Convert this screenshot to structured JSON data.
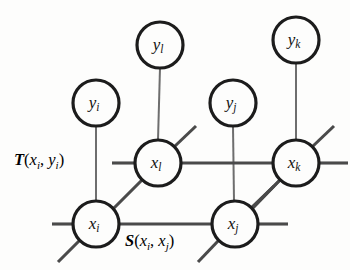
{
  "figure": {
    "background_color": "#fdfdfc",
    "edge_color": "#4a4a4a",
    "node_stroke_color": "#1c1c1c",
    "node_fill_color": "#fdfdfc",
    "label_color": "#101010"
  },
  "nodes": [
    {
      "id": "y_l",
      "base": "y",
      "sub": "l",
      "cx": 160,
      "cy": 45,
      "r": 23
    },
    {
      "id": "y_k",
      "base": "y",
      "sub": "k",
      "cx": 296,
      "cy": 40,
      "r": 23
    },
    {
      "id": "y_i",
      "base": "y",
      "sub": "i",
      "cx": 96,
      "cy": 103,
      "r": 23
    },
    {
      "id": "y_j",
      "base": "y",
      "sub": "j",
      "cx": 233,
      "cy": 103,
      "r": 23
    },
    {
      "id": "x_l",
      "base": "x",
      "sub": "l",
      "cx": 158,
      "cy": 163,
      "r": 23
    },
    {
      "id": "x_k",
      "base": "x",
      "sub": "k",
      "cx": 296,
      "cy": 163,
      "r": 23
    },
    {
      "id": "x_i",
      "base": "x",
      "sub": "i",
      "cx": 96,
      "cy": 224,
      "r": 23
    },
    {
      "id": "x_j",
      "base": "x",
      "sub": "j",
      "cx": 235,
      "cy": 224,
      "r": 23
    }
  ],
  "edges": [
    {
      "id": "edge-yl-xl",
      "from": "y_l",
      "to": "x_l",
      "kind": "thin",
      "x1": 160,
      "y1": 68,
      "x2": 158,
      "y2": 140
    },
    {
      "id": "edge-yk-xk",
      "from": "y_k",
      "to": "x_k",
      "kind": "thin",
      "x1": 296,
      "y1": 63,
      "x2": 296,
      "y2": 140
    },
    {
      "id": "edge-yi-xi",
      "from": "y_i",
      "to": "x_i",
      "kind": "thin",
      "x1": 96,
      "y1": 126,
      "x2": 96,
      "y2": 201
    },
    {
      "id": "edge-yj-xj",
      "from": "y_j",
      "to": "x_j",
      "kind": "thin",
      "x1": 233,
      "y1": 126,
      "x2": 234,
      "y2": 201
    },
    {
      "id": "edge-xl-xk",
      "from": "x_l",
      "to": "x_k",
      "kind": "main",
      "x1": 181,
      "y1": 163,
      "x2": 273,
      "y2": 163
    },
    {
      "id": "edge-xi-xj",
      "from": "x_i",
      "to": "x_j",
      "kind": "main",
      "x1": 119,
      "y1": 224,
      "x2": 212,
      "y2": 224
    },
    {
      "id": "edge-xi-xl",
      "from": "x_i",
      "to": "x_l",
      "kind": "main",
      "x1": 113,
      "y1": 209,
      "x2": 142,
      "y2": 180
    },
    {
      "id": "edge-xj-xk",
      "from": "x_j",
      "to": "x_k",
      "kind": "main",
      "x1": 252,
      "y1": 209,
      "x2": 280,
      "y2": 180
    }
  ],
  "stubs": [
    {
      "id": "stub-xl-left",
      "at": "x_l",
      "kind": "main",
      "x1": 112,
      "y1": 163,
      "x2": 135,
      "y2": 163
    },
    {
      "id": "stub-xl-upright",
      "at": "x_l",
      "kind": "main",
      "x1": 174,
      "y1": 147,
      "x2": 196,
      "y2": 126
    },
    {
      "id": "stub-xk-right",
      "at": "x_k",
      "kind": "main",
      "x1": 319,
      "y1": 163,
      "x2": 348,
      "y2": 163
    },
    {
      "id": "stub-xk-upright",
      "at": "x_k",
      "kind": "main",
      "x1": 312,
      "y1": 147,
      "x2": 334,
      "y2": 126
    },
    {
      "id": "stub-xk-downleft",
      "at": "x_k",
      "kind": "main",
      "x1": 280,
      "y1": 180,
      "x2": 258,
      "y2": 202
    },
    {
      "id": "stub-xi-left",
      "at": "x_i",
      "kind": "main",
      "x1": 52,
      "y1": 224,
      "x2": 73,
      "y2": 224
    },
    {
      "id": "stub-xi-downleft",
      "at": "x_i",
      "kind": "main",
      "x1": 80,
      "y1": 240,
      "x2": 58,
      "y2": 262
    },
    {
      "id": "stub-xj-right",
      "at": "x_j",
      "kind": "main",
      "x1": 258,
      "y1": 224,
      "x2": 288,
      "y2": 224
    },
    {
      "id": "stub-xj-upright",
      "at": "x_j",
      "kind": "main",
      "x1": 251,
      "y1": 208,
      "x2": 274,
      "y2": 186
    },
    {
      "id": "stub-xj-downleft",
      "at": "x_j",
      "kind": "main",
      "x1": 219,
      "y1": 240,
      "x2": 198,
      "y2": 262
    }
  ],
  "function_labels": [
    {
      "id": "label-T",
      "name": "T",
      "args": [
        {
          "base": "x",
          "sub": "i"
        },
        {
          "base": "y",
          "sub": "i"
        }
      ],
      "text": "T(x_i, y_i)",
      "left": 14,
      "top": 150
    },
    {
      "id": "label-S",
      "name": "S",
      "args": [
        {
          "base": "x",
          "sub": "i"
        },
        {
          "base": "x",
          "sub": "j"
        }
      ],
      "text": "S(x_i, x_j)",
      "left": 125,
      "top": 231
    }
  ]
}
